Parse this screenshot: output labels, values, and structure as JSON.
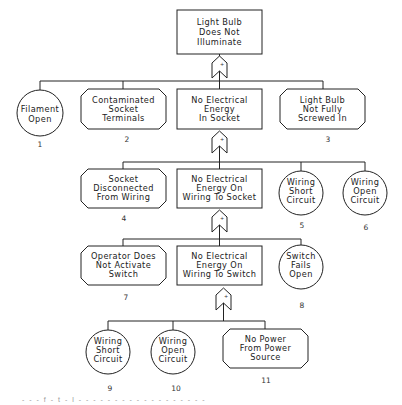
{
  "diagram": {
    "type": "fault-tree",
    "top_event": {
      "lines": [
        "Light Bulb",
        "Does Not",
        "Illuminate"
      ]
    },
    "gates": [
      {
        "id": "g1",
        "symbol": "+",
        "type": "OR"
      },
      {
        "id": "g2",
        "symbol": "+",
        "type": "OR"
      },
      {
        "id": "g3",
        "symbol": "+",
        "type": "OR"
      },
      {
        "id": "g4",
        "symbol": "+",
        "type": "OR"
      }
    ],
    "row1": {
      "filament_open": {
        "lines": [
          "Filament",
          "Open"
        ],
        "number": "1",
        "shape": "circle"
      },
      "contaminated": {
        "lines": [
          "Contaminated",
          "Socket",
          "Terminals"
        ],
        "number": "2",
        "shape": "octagon"
      },
      "no_energy_socket": {
        "lines": [
          "No Electrical",
          "Energy",
          "In Socket"
        ],
        "shape": "rectangle"
      },
      "not_screwed": {
        "lines": [
          "Light Bulb",
          "Not Fully",
          "Screwed In"
        ],
        "number": "3",
        "shape": "octagon"
      }
    },
    "row2": {
      "socket_disconnected": {
        "lines": [
          "Socket",
          "Disconnected",
          "From Wiring"
        ],
        "number": "4",
        "shape": "octagon"
      },
      "no_energy_wiring_socket": {
        "lines": [
          "No Electrical",
          "Energy On",
          "Wiring To Socket"
        ],
        "shape": "rectangle"
      },
      "wiring_short": {
        "lines": [
          "Wiring",
          "Short",
          "Circuit"
        ],
        "number": "5",
        "shape": "circle"
      },
      "wiring_open": {
        "lines": [
          "Wiring",
          "Open",
          "Circuit"
        ],
        "number": "6",
        "shape": "circle"
      }
    },
    "row3": {
      "operator": {
        "lines": [
          "Operator Does",
          "Not Activate",
          "Switch"
        ],
        "number": "7",
        "shape": "octagon"
      },
      "no_energy_wiring_switch": {
        "lines": [
          "No Electrical",
          "Energy On",
          "Wiring To Switch"
        ],
        "shape": "rectangle"
      },
      "switch_fails": {
        "lines": [
          "Switch",
          "Fails",
          "Open"
        ],
        "number": "8",
        "shape": "circle"
      }
    },
    "row4": {
      "wiring_short": {
        "lines": [
          "Wiring",
          "Short",
          "Circuit"
        ],
        "number": "9",
        "shape": "circle"
      },
      "wiring_open": {
        "lines": [
          "Wiring",
          "Open",
          "Circuit"
        ],
        "number": "10",
        "shape": "circle"
      },
      "no_power": {
        "lines": [
          "No Power",
          "From Power",
          "Source"
        ],
        "number": "11",
        "shape": "octagon"
      }
    }
  },
  "caption": {
    "text": "- - - f - t - l -   - - - -   - - - -   - - - - - - - - -"
  }
}
